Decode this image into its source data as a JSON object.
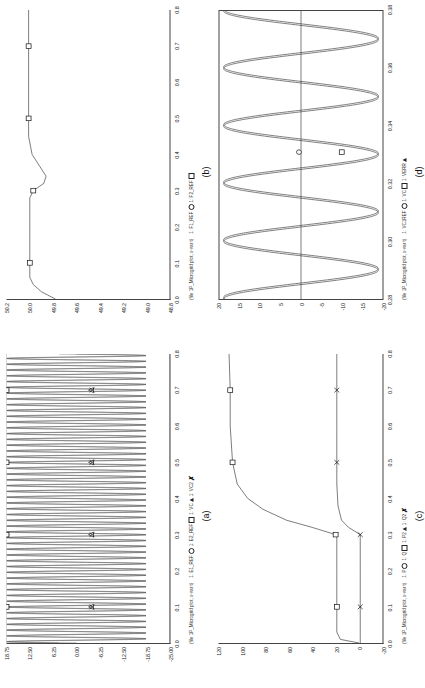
{
  "sheet": {
    "title": "Microgrid simulation result plots"
  },
  "markers": {
    "circle": "○",
    "square": "□",
    "triangle": "△",
    "cross": "✗"
  },
  "panels": [
    {
      "id": "a",
      "caption": "(a)",
      "fileref": "(file 1P_Microgrid plot, x-var t)",
      "legend": [
        {
          "label": "1: E1_REF",
          "marker": "circle"
        },
        {
          "label": "1: E2_REF",
          "marker": "square"
        },
        {
          "label": "1: VC",
          "marker": "triangle"
        },
        {
          "label": "1: VC2",
          "marker": "cross"
        }
      ],
      "yticks": [
        "18.75",
        "12.50",
        "6.25",
        "0.00",
        "-6.25",
        "-12.50",
        "-18.75",
        "-25.00"
      ],
      "yvalues": [
        18.75,
        12.5,
        6.25,
        0,
        -6.25,
        -12.5,
        -18.75,
        -25
      ],
      "xticks": [
        "0.0",
        "0.1",
        "0.2",
        "0.3",
        "0.4",
        "0.5",
        "0.6",
        "0.7",
        "0.8"
      ],
      "xvalues": [
        0.0,
        0.1,
        0.2,
        0.3,
        0.4,
        0.5,
        0.6,
        0.7,
        0.8
      ]
    },
    {
      "id": "b",
      "caption": "(b)",
      "fileref": "(file 1P_Microgrid plot, x-var t)",
      "legend": [
        {
          "label": "1: F1_REF",
          "marker": "circle"
        },
        {
          "label": "1: F2_REF",
          "marker": "square"
        }
      ],
      "yticks": [
        "50.2",
        "50.0",
        "49.8",
        "49.6",
        "49.4",
        "49.2",
        "49.0",
        "48.8"
      ],
      "yvalues": [
        50.2,
        50.0,
        49.8,
        49.6,
        49.4,
        49.2,
        49.0,
        48.8
      ],
      "xticks": [
        "0.0",
        "0.1",
        "0.2",
        "0.3",
        "0.4",
        "0.5",
        "0.6",
        "0.7",
        "0.8"
      ],
      "xvalues": [
        0.0,
        0.1,
        0.2,
        0.3,
        0.4,
        0.5,
        0.6,
        0.7,
        0.8
      ]
    },
    {
      "id": "c",
      "caption": "(c)",
      "fileref": "(file 1P_Microgrid plot, x-var t)",
      "legend": [
        {
          "label": "1: P",
          "marker": "circle"
        },
        {
          "label": "1: Q",
          "marker": "square"
        },
        {
          "label": "1: P2",
          "marker": "triangle"
        },
        {
          "label": "1: Q2",
          "marker": "cross"
        }
      ],
      "yticks": [
        "120",
        "100",
        "80",
        "60",
        "40",
        "20",
        "0",
        "-20"
      ],
      "yvalues": [
        120,
        100,
        80,
        60,
        40,
        20,
        0,
        -20
      ],
      "xticks": [
        "0.0",
        "0.1",
        "0.2",
        "0.3",
        "0.4",
        "0.5",
        "0.6",
        "0.7",
        "0.8"
      ],
      "xvalues": [
        0.0,
        0.1,
        0.2,
        0.3,
        0.4,
        0.5,
        0.6,
        0.7,
        0.8
      ]
    },
    {
      "id": "d",
      "caption": "(d)",
      "fileref": "(file 1P_Microgrid plot, x-var t)",
      "legend": [
        {
          "label": "1: VC1REF",
          "marker": "circle"
        },
        {
          "label": "1: VC",
          "marker": "square"
        },
        {
          "label": "1: VERR",
          "marker": "triangle"
        }
      ],
      "yticks": [
        "20",
        "15",
        "10",
        "5",
        "0",
        "-5",
        "-10",
        "-15",
        "-20"
      ],
      "yvalues": [
        20,
        15,
        10,
        5,
        0,
        -5,
        -10,
        -15,
        -20
      ],
      "xticks": [
        "0.28",
        "0.30",
        "0.32",
        "0.34",
        "0.36",
        "0.38"
      ],
      "xvalues": [
        0.28,
        0.3,
        0.32,
        0.34,
        0.36,
        0.38
      ]
    }
  ],
  "chart_data": [
    {
      "id": "a",
      "type": "line",
      "title": "(a)",
      "xlabel": "t",
      "ylabel": "",
      "xlim": [
        0.0,
        0.8
      ],
      "ylim": [
        -25.0,
        18.75
      ],
      "grid": false,
      "legend_position": "below-axis",
      "series": [
        {
          "name": "1: E1_REF",
          "marker": "circle",
          "description": "constant reference envelope, marker samples only",
          "marker_points": [
            {
              "x": 0.1,
              "y": 18.75
            },
            {
              "x": 0.3,
              "y": 18.75
            },
            {
              "x": 0.5,
              "y": 18.75
            },
            {
              "x": 0.7,
              "y": 18.75
            }
          ]
        },
        {
          "name": "1: E2_REF",
          "marker": "square",
          "description": "upper envelope of sinusoidal band, near 18.75",
          "marker_points": [
            {
              "x": 0.1,
              "y": 18.75
            },
            {
              "x": 0.3,
              "y": 18.75
            },
            {
              "x": 0.5,
              "y": 18.75
            },
            {
              "x": 0.7,
              "y": 18.75
            }
          ]
        },
        {
          "name": "1: VC",
          "marker": "triangle",
          "description": "high-frequency sinusoid, amplitude ~18.7, ~50 cycles over 0-0.8 s",
          "amplitude": 18.7,
          "frequency_hz": 62.5,
          "offset": 0.0,
          "marker_points": [
            {
              "x": 0.1,
              "y": -4.0
            },
            {
              "x": 0.3,
              "y": -4.0
            },
            {
              "x": 0.5,
              "y": -4.0
            },
            {
              "x": 0.7,
              "y": -4.0
            }
          ]
        },
        {
          "name": "1: VC2",
          "marker": "cross",
          "description": "second high-frequency sinusoid, nearly coincident with VC",
          "amplitude": 18.7,
          "frequency_hz": 62.5,
          "offset": 0.0,
          "marker_points": [
            {
              "x": 0.1,
              "y": -4.2
            },
            {
              "x": 0.3,
              "y": -4.2
            },
            {
              "x": 0.5,
              "y": -4.2
            },
            {
              "x": 0.7,
              "y": -4.2
            }
          ]
        }
      ]
    },
    {
      "id": "b",
      "type": "line",
      "title": "(b)",
      "xlabel": "t",
      "ylabel": "",
      "xlim": [
        0.0,
        0.8
      ],
      "ylim": [
        48.8,
        50.2
      ],
      "grid": false,
      "legend_position": "below-axis",
      "series": [
        {
          "name": "1: F1_REF",
          "marker": "circle",
          "points": [
            {
              "x": 0.0,
              "y": 49.78
            },
            {
              "x": 0.02,
              "y": 49.9
            },
            {
              "x": 0.04,
              "y": 49.97
            },
            {
              "x": 0.06,
              "y": 50.0
            },
            {
              "x": 0.1,
              "y": 50.0
            },
            {
              "x": 0.2,
              "y": 50.0
            },
            {
              "x": 0.28,
              "y": 50.0
            },
            {
              "x": 0.3,
              "y": 49.97
            },
            {
              "x": 0.32,
              "y": 49.88
            },
            {
              "x": 0.34,
              "y": 49.86
            },
            {
              "x": 0.36,
              "y": 49.9
            },
            {
              "x": 0.4,
              "y": 49.98
            },
            {
              "x": 0.45,
              "y": 50.01
            },
            {
              "x": 0.5,
              "y": 50.01
            },
            {
              "x": 0.6,
              "y": 50.01
            },
            {
              "x": 0.7,
              "y": 50.01
            },
            {
              "x": 0.8,
              "y": 50.01
            }
          ]
        },
        {
          "name": "1: F2_REF",
          "marker": "square",
          "marker_points": [
            {
              "x": 0.1,
              "y": 50.0
            },
            {
              "x": 0.3,
              "y": 49.97
            },
            {
              "x": 0.5,
              "y": 50.01
            },
            {
              "x": 0.7,
              "y": 50.01
            }
          ]
        }
      ]
    },
    {
      "id": "c",
      "type": "line",
      "title": "(c)",
      "xlabel": "t",
      "ylabel": "",
      "xlim": [
        0.0,
        0.8
      ],
      "ylim": [
        -20,
        120
      ],
      "grid": false,
      "legend_position": "below-axis",
      "series": [
        {
          "name": "1: P",
          "marker": "circle",
          "points": [
            {
              "x": 0.0,
              "y": 0
            },
            {
              "x": 0.01,
              "y": 16
            },
            {
              "x": 0.03,
              "y": 19
            },
            {
              "x": 0.06,
              "y": 19
            },
            {
              "x": 0.1,
              "y": 19
            },
            {
              "x": 0.2,
              "y": 19
            },
            {
              "x": 0.29,
              "y": 19
            },
            {
              "x": 0.3,
              "y": 20
            },
            {
              "x": 0.32,
              "y": 40
            },
            {
              "x": 0.34,
              "y": 62
            },
            {
              "x": 0.37,
              "y": 82
            },
            {
              "x": 0.4,
              "y": 95
            },
            {
              "x": 0.44,
              "y": 104
            },
            {
              "x": 0.5,
              "y": 108
            },
            {
              "x": 0.6,
              "y": 110
            },
            {
              "x": 0.7,
              "y": 110
            },
            {
              "x": 0.8,
              "y": 111
            }
          ]
        },
        {
          "name": "1: Q",
          "marker": "square",
          "marker_points": [
            {
              "x": 0.1,
              "y": 19
            },
            {
              "x": 0.3,
              "y": 20
            },
            {
              "x": 0.5,
              "y": 108
            },
            {
              "x": 0.7,
              "y": 110
            }
          ]
        },
        {
          "name": "1: P2",
          "marker": "triangle",
          "points": [
            {
              "x": 0.0,
              "y": -1
            },
            {
              "x": 0.02,
              "y": -1
            },
            {
              "x": 0.1,
              "y": -1
            },
            {
              "x": 0.2,
              "y": -1
            },
            {
              "x": 0.29,
              "y": -1
            },
            {
              "x": 0.3,
              "y": -1
            },
            {
              "x": 0.32,
              "y": 9
            },
            {
              "x": 0.34,
              "y": 15
            },
            {
              "x": 0.38,
              "y": 18
            },
            {
              "x": 0.44,
              "y": 19
            },
            {
              "x": 0.5,
              "y": 19
            },
            {
              "x": 0.6,
              "y": 19
            },
            {
              "x": 0.7,
              "y": 19
            },
            {
              "x": 0.8,
              "y": 19
            }
          ]
        },
        {
          "name": "1: Q2",
          "marker": "cross",
          "marker_points": [
            {
              "x": 0.1,
              "y": -1
            },
            {
              "x": 0.3,
              "y": -1
            },
            {
              "x": 0.5,
              "y": 19
            },
            {
              "x": 0.7,
              "y": 19
            }
          ]
        }
      ]
    },
    {
      "id": "d",
      "type": "line",
      "title": "(d)",
      "xlabel": "t",
      "ylabel": "",
      "xlim": [
        0.28,
        0.38
      ],
      "ylim": [
        -20,
        20
      ],
      "grid": false,
      "legend_position": "below-axis",
      "series": [
        {
          "name": "1: VC1REF",
          "marker": "circle",
          "description": "sinusoid amplitude ~19, 5 cycles over 0.28-0.38 s (50 Hz)",
          "amplitude": 19,
          "frequency_hz": 50,
          "phase_deg": 90,
          "marker_points": [
            {
              "x": 0.331,
              "y": 0.5
            }
          ]
        },
        {
          "name": "1: VC",
          "marker": "square",
          "description": "sinusoid amplitude ~19, slightly phase shifted from VC1REF",
          "amplitude": 19,
          "frequency_hz": 50,
          "phase_deg": 80,
          "marker_points": [
            {
              "x": 0.331,
              "y": -10.0
            }
          ]
        },
        {
          "name": "1: VERR",
          "marker": "triangle",
          "description": "error signal, flat near zero across the window",
          "value": 0.0
        }
      ]
    }
  ]
}
